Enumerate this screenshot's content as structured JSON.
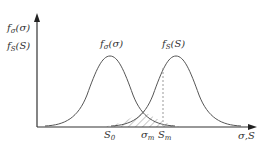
{
  "diagram": {
    "y_axis_labels": [
      "fσ(σ)",
      "fS(S)"
    ],
    "curves": [
      {
        "label": "fσ(σ)",
        "role": "stress distribution",
        "peak_x": 110
      },
      {
        "label": "fS(S)",
        "role": "strength distribution",
        "peak_x": 176
      }
    ],
    "x_axis_label": "σ,S",
    "x_markers": [
      {
        "label": "S0",
        "x": 108
      },
      {
        "label": "σm",
        "x": 146
      },
      {
        "label": "Sm",
        "x": 163
      }
    ],
    "hatched_region": "interference area between curves",
    "dashed_line_at": "Sm",
    "colors": {
      "line": "#555555",
      "axis": "#333333",
      "dashed": "#999999",
      "hatch": "#666666"
    }
  },
  "labels": {
    "y1_main": "f",
    "y1_sub": "σ",
    "y1_arg": "(σ)",
    "y2_main": "f",
    "y2_sub": "S",
    "y2_arg": "(S)",
    "c1_main": "f",
    "c1_sub": "σ",
    "c1_arg": "(σ)",
    "c2_main": "f",
    "c2_sub": "S",
    "c2_arg": "(S)",
    "s0_main": "S",
    "s0_sub": "0",
    "sigm_main": "σ",
    "sigm_sub": "m",
    "sm_main": "S",
    "sm_sub": "m",
    "xaxis": "σ,S"
  }
}
